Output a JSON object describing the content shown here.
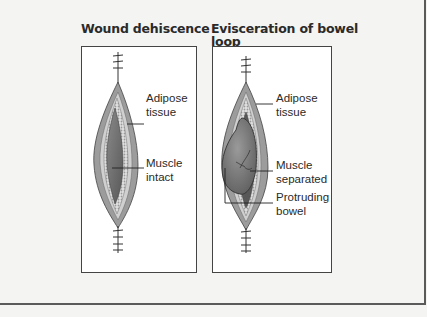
{
  "figure": {
    "panels": [
      {
        "title": "Wound dehiscence",
        "labels": [
          {
            "lines": [
              "Adipose",
              "tissue"
            ]
          },
          {
            "lines": [
              "Muscle",
              "intact"
            ]
          }
        ]
      },
      {
        "title_lines": [
          "Evisceration of bowel",
          "loop"
        ],
        "labels": [
          {
            "lines": [
              "Adipose",
              "tissue"
            ]
          },
          {
            "lines": [
              "Muscle",
              "separated"
            ]
          },
          {
            "lines": [
              "Protruding",
              "bowel"
            ]
          }
        ]
      }
    ],
    "colors": {
      "skin": "#9c9c9c",
      "adipose": "#d6d6d6",
      "muscle": "#6e6e6e",
      "bowel": "#7a7a7a",
      "line": "#333333"
    }
  }
}
